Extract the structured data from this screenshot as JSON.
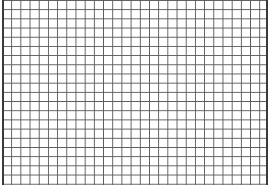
{
  "document": {
    "kind": "grid-pattern",
    "description": "Graph-paper style ruled grid filling the frame",
    "width_px": 275,
    "height_px": 185
  },
  "grid": {
    "columns": 29,
    "rows": 20,
    "cell_width_px": 9.2,
    "cell_height_px": 9.2,
    "line_width_px": 1,
    "line_color": "#5a5a5a",
    "cell_color": "#ffffff",
    "background_color": "#ffffff"
  },
  "frame": {
    "left_margin_px": 2,
    "right_margin_px": 7,
    "top_margin_px": 0,
    "bottom_margin_px": 0,
    "surface_left_px": 2,
    "surface_width_px": 266,
    "border_rule_color": "#3a3a3a",
    "border_rule_width_px": 2,
    "left_rule_x_px": 2,
    "right_rule_x_px": 266
  },
  "annotations": {
    "text_present": false,
    "labels": [],
    "data_marks": []
  }
}
